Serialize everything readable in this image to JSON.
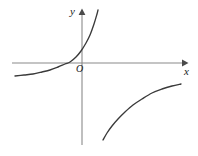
{
  "figure": {
    "kind": "coordinate-plane-graph",
    "background_color": "#ffffff",
    "stroke_color": "#3a3a3a",
    "axis_color": "#8a8a8a",
    "labels": {
      "y_axis": "y",
      "x_axis": "x",
      "origin": "O"
    }
  },
  "chart_data": {
    "type": "line",
    "title": "",
    "xlabel": "x",
    "ylabel": "y",
    "grid": false,
    "legend": null,
    "axes": {
      "origin_px": [
        82,
        63
      ],
      "x_axis_px": {
        "start": [
          12,
          63
        ],
        "end": [
          185,
          63
        ],
        "arrow": "right"
      },
      "y_axis_px": {
        "start": [
          82,
          145
        ],
        "end": [
          82,
          11
        ],
        "arrow": "up"
      },
      "origin_label": "O",
      "tick_labels": []
    },
    "series": [
      {
        "name": "exponential-curve",
        "description": "increasing concave-up curve crossing the x-axis left of the origin and rising steeply in the first quadrant",
        "points_px": [
          [
            15,
            76
          ],
          [
            24,
            75
          ],
          [
            33,
            74
          ],
          [
            42,
            72
          ],
          [
            50,
            70
          ],
          [
            58,
            67
          ],
          [
            65,
            64
          ],
          [
            70,
            62
          ],
          [
            76,
            57
          ],
          [
            81,
            51
          ],
          [
            86,
            43
          ],
          [
            90,
            35
          ],
          [
            94,
            24
          ],
          [
            97,
            14
          ],
          [
            98,
            10
          ]
        ]
      },
      {
        "name": "hyperbola-branch",
        "description": "increasing concave-down branch in the fourth quadrant approaching the x-axis from below",
        "points_px": [
          [
            103,
            140
          ],
          [
            107,
            133
          ],
          [
            112,
            126
          ],
          [
            118,
            119
          ],
          [
            125,
            112
          ],
          [
            133,
            105
          ],
          [
            142,
            99
          ],
          [
            152,
            93
          ],
          [
            162,
            89
          ],
          [
            172,
            86
          ],
          [
            181,
            84
          ]
        ]
      }
    ]
  }
}
